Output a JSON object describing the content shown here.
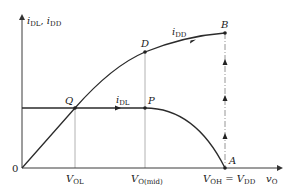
{
  "axes": {
    "y_label_main": "i",
    "y_label_sub1": "DL",
    "y_label_sep": ", ",
    "y_label_main2": "i",
    "y_label_sub2": "DD",
    "x_label_main": "v",
    "x_label_sub": "O",
    "origin_label": "0"
  },
  "ticks": {
    "vol_main": "V",
    "vol_sub": "OL",
    "vomid_main": "V",
    "vomid_sub": "O(mid)",
    "voh_main": "V",
    "voh_sub": "OH",
    "voh_eq": " = ",
    "vdd_main": "V",
    "vdd_sub": "DD"
  },
  "points": {
    "Q": "Q",
    "P": "P",
    "D": "D",
    "B": "B",
    "A": "A"
  },
  "curves": {
    "idl_main": "i",
    "idl_sub": "DL",
    "idd_main": "i",
    "idd_sub": "DD"
  },
  "colors": {
    "curve": "#2b2b2b",
    "axis": "#3a3a3a",
    "guide": "#9a9a9a"
  }
}
